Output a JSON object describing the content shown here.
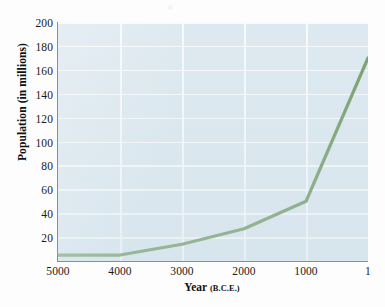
{
  "chart_data": {
    "type": "line",
    "title": "",
    "xlabel": "Year",
    "xlabel_qualifier": "(B.C.E.)",
    "ylabel": "Population (in millions)",
    "x": [
      5000,
      4000,
      3000,
      2000,
      1000,
      1
    ],
    "values": [
      5,
      5,
      14,
      27,
      50,
      170
    ],
    "series": [
      {
        "name": "World population",
        "values": [
          5,
          5,
          14,
          27,
          50,
          170
        ]
      }
    ],
    "x_tick_labels": [
      "5000",
      "4000",
      "3000",
      "2000",
      "1000",
      "1"
    ],
    "y_tick_labels": [
      "20",
      "40",
      "60",
      "80",
      "100",
      "120",
      "140",
      "160",
      "180",
      "200"
    ],
    "y_ticks": [
      20,
      40,
      60,
      80,
      100,
      120,
      140,
      160,
      180,
      200
    ],
    "xlim": [
      5000,
      1
    ],
    "ylim": [
      0,
      200
    ],
    "x_axis_reversed": true,
    "grid": true,
    "legend": "none",
    "line_color": "#5d8b47",
    "plot_background_color": "#dde8ef",
    "gridline_color": "#ffffff",
    "axis_line_color": "#8b8f90"
  }
}
